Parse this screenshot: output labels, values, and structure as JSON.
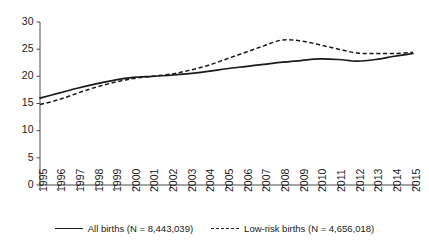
{
  "chart_data": {
    "type": "line",
    "title": "",
    "xlabel": "",
    "ylabel": "",
    "grid": false,
    "legend_position": "bottom",
    "xlim": [
      1995,
      2015
    ],
    "ylim": [
      0,
      30
    ],
    "yticks": [
      0,
      5,
      10,
      15,
      20,
      25,
      30
    ],
    "categories": [
      1995,
      1996,
      1997,
      1998,
      1999,
      2000,
      2001,
      2002,
      2003,
      2004,
      2005,
      2006,
      2007,
      2008,
      2009,
      2010,
      2011,
      2012,
      2013,
      2014,
      2015
    ],
    "x": [
      "1995",
      "1996",
      "1997",
      "1998",
      "1999",
      "2000",
      "2001",
      "2002",
      "2003",
      "2004",
      "2005",
      "2006",
      "2007",
      "2008",
      "2009",
      "2010",
      "2011",
      "2012",
      "2013",
      "2014",
      "2015"
    ],
    "series": [
      {
        "name": "All births (N = 8,443,039)",
        "style": "solid",
        "color": "#1a1a1a",
        "values": [
          16.0,
          16.9,
          17.8,
          18.6,
          19.3,
          19.8,
          20.0,
          20.2,
          20.5,
          20.9,
          21.4,
          21.8,
          22.2,
          22.6,
          22.9,
          23.2,
          23.1,
          22.8,
          23.1,
          23.7,
          24.2
        ]
      },
      {
        "name": "Low-risk births (N = 4,656,018)",
        "style": "dashed",
        "color": "#1a1a1a",
        "values": [
          14.8,
          15.7,
          16.9,
          18.0,
          18.9,
          19.6,
          20.0,
          20.4,
          21.1,
          22.0,
          23.2,
          24.4,
          25.6,
          26.7,
          26.5,
          25.8,
          25.0,
          24.3,
          24.2,
          24.2,
          24.4
        ]
      }
    ]
  },
  "legend": {
    "items": [
      {
        "label": "All births (N = 8,443,039)",
        "style": "solid"
      },
      {
        "label": "Low-risk births (N = 4,656,018)",
        "style": "dashed"
      }
    ]
  },
  "colors": {
    "axis": "#4a4a4a",
    "ink": "#1a1a1a",
    "background": "#ffffff"
  }
}
